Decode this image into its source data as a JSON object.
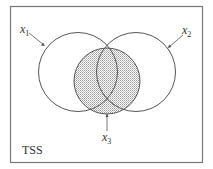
{
  "diagram": {
    "type": "venn",
    "frame_label": "TSS",
    "sets": [
      {
        "id": "x1",
        "label_base": "x",
        "label_sub": "1",
        "shaded": false
      },
      {
        "id": "x2",
        "label_base": "x",
        "label_sub": "2",
        "shaded": false
      },
      {
        "id": "x3",
        "label_base": "x",
        "label_sub": "3",
        "shaded": true
      }
    ],
    "colors": {
      "stroke": "#555555",
      "frame": "#777777",
      "shade": "#cfcfcf",
      "text": "#333333"
    }
  }
}
